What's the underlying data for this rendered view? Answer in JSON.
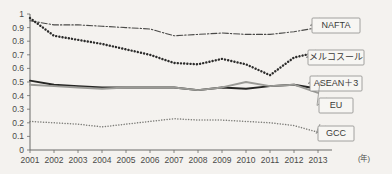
{
  "chart_data": {
    "type": "line",
    "title": "",
    "xlabel": "(年)",
    "ylabel": "",
    "xlim": [
      2001,
      2013
    ],
    "ylim": [
      0,
      1
    ],
    "grid": false,
    "legend_position": "right-callouts",
    "categories": [
      2001,
      2002,
      2003,
      2004,
      2005,
      2006,
      2007,
      2008,
      2009,
      2010,
      2011,
      2012,
      2013
    ],
    "x_tick_labels": [
      "2001",
      "2002",
      "2003",
      "2004",
      "2005",
      "2006",
      "2007",
      "2008",
      "2009",
      "2010",
      "2011",
      "2012",
      "2013"
    ],
    "y_tick_labels": [
      "0",
      "0.1",
      "0.2",
      "0.3",
      "0.4",
      "0.5",
      "0.6",
      "0.7",
      "0.8",
      "0.9",
      "1"
    ],
    "y_ticks": [
      0,
      0.1,
      0.2,
      0.3,
      0.4,
      0.5,
      0.6,
      0.7,
      0.8,
      0.9,
      1
    ],
    "series": [
      {
        "name": "NAFTA",
        "style": "dash-dot",
        "color": "#4a4a48",
        "values": [
          0.95,
          0.92,
          0.92,
          0.91,
          0.9,
          0.89,
          0.84,
          0.85,
          0.86,
          0.85,
          0.85,
          0.87,
          0.9
        ]
      },
      {
        "name": "メルコスール",
        "style": "dotted-heavy",
        "color": "#2b2b2a",
        "values": [
          0.97,
          0.84,
          0.81,
          0.78,
          0.74,
          0.7,
          0.64,
          0.63,
          0.67,
          0.63,
          0.55,
          0.68,
          0.72
        ]
      },
      {
        "name": "ASEAN＋3",
        "style": "solid",
        "color": "#262624",
        "values": [
          0.51,
          0.48,
          0.47,
          0.46,
          0.46,
          0.46,
          0.46,
          0.44,
          0.46,
          0.45,
          0.47,
          0.48,
          0.45
        ]
      },
      {
        "name": "EU",
        "style": "solid",
        "color": "#9a9a96",
        "values": [
          0.48,
          0.47,
          0.46,
          0.45,
          0.46,
          0.46,
          0.46,
          0.44,
          0.46,
          0.5,
          0.47,
          0.48,
          0.42
        ]
      },
      {
        "name": "GCC",
        "style": "dotted-fine",
        "color": "#7d7d79",
        "values": [
          0.21,
          0.2,
          0.19,
          0.17,
          0.19,
          0.21,
          0.23,
          0.22,
          0.22,
          0.21,
          0.2,
          0.18,
          0.13
        ]
      }
    ]
  },
  "legend": {
    "items": [
      {
        "label": "NAFTA",
        "box_y": 18,
        "anchor_y": 26
      },
      {
        "label": "メルコスール",
        "box_y": 50,
        "anchor_y": 56
      },
      {
        "label": "ASEAN＋3",
        "box_y": 76,
        "anchor_y": 80
      },
      {
        "label": "EU",
        "box_y": 98,
        "anchor_y": 82
      },
      {
        "label": "GCC",
        "box_y": 126,
        "anchor_y": 124
      }
    ]
  },
  "axis": {
    "x_unit": "(年)"
  }
}
